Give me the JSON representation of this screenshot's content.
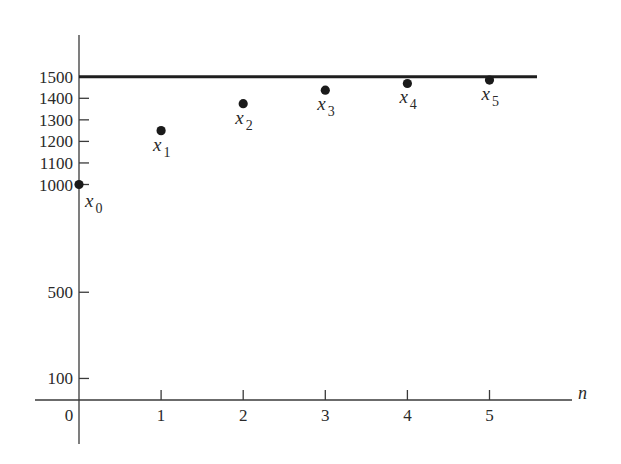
{
  "chart_data": {
    "type": "scatter",
    "title": "",
    "xlabel": "n",
    "ylabel": "",
    "x": [
      0,
      1,
      2,
      3,
      4,
      5
    ],
    "series": [
      {
        "name": "x_n",
        "values": [
          1000,
          1250,
          1375,
          1437.5,
          1468.75,
          1484.375
        ],
        "point_labels": [
          {
            "base": "x",
            "sub": "0"
          },
          {
            "base": "x",
            "sub": "1"
          },
          {
            "base": "x",
            "sub": "2"
          },
          {
            "base": "x",
            "sub": "3"
          },
          {
            "base": "x",
            "sub": "4"
          },
          {
            "base": "x",
            "sub": "5"
          }
        ]
      }
    ],
    "reference_lines": [
      {
        "orientation": "horizontal",
        "value": 1500,
        "style": "thick solid"
      }
    ],
    "xticks": [
      "0",
      "1",
      "2",
      "3",
      "4",
      "5"
    ],
    "yticks": [
      "100",
      "500",
      "1000",
      "1100",
      "1200",
      "1300",
      "1400",
      "1500"
    ],
    "ytick_values": [
      100,
      500,
      1000,
      1100,
      1200,
      1300,
      1400,
      1500
    ],
    "xlim": [
      0,
      5.6
    ],
    "ylim": [
      0,
      1650
    ],
    "grid": false,
    "legend": null
  }
}
